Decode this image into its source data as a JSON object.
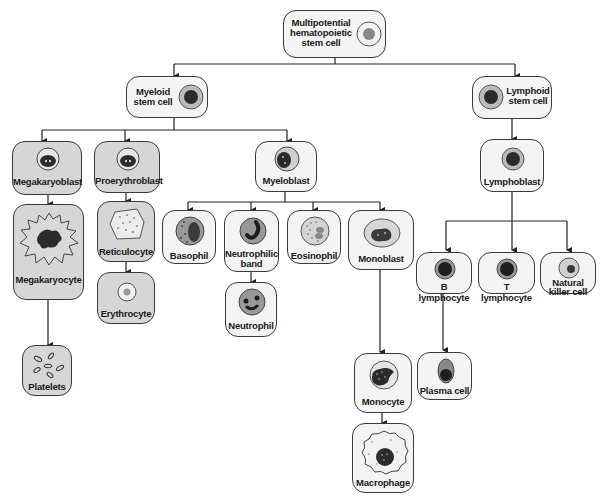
{
  "colors": {
    "box_fill": "#e9e9e9",
    "box_fill_light": "#f4f4f4",
    "box_fill_dark": "#d6d6d6",
    "box_border": "#3a3a3a",
    "nucleus_dark": "#2b2b2b",
    "nucleus_gray": "#7a7a7a",
    "cytoplasm": "#bdbdbd",
    "line": "#222222"
  },
  "nodes": {
    "stem": {
      "label": "Multipotential hematopoietic stem cell",
      "line1": "Multipotential",
      "line2": "hematopoietic",
      "line3": "stem cell",
      "icon": "stem-cell-icon"
    },
    "myeloid": {
      "label": "Myeloid stem cell",
      "line1": "Myeloid",
      "line2": "stem cell",
      "icon": "myeloid-stem-cell-icon"
    },
    "lymphoid": {
      "label": "Lymphoid stem cell",
      "line1": "Lymphoid",
      "line2": "stem cell",
      "icon": "lymphoid-stem-cell-icon"
    },
    "megakaryoblast": {
      "label": "Megakaryoblast",
      "icon": "megakaryoblast-icon"
    },
    "proerythroblast": {
      "label": "Proerythroblast",
      "icon": "proerythroblast-icon"
    },
    "myeloblast": {
      "label": "Myeloblast",
      "icon": "myeloblast-icon"
    },
    "lymphoblast": {
      "label": "Lymphoblast",
      "icon": "lymphoblast-icon"
    },
    "megakaryocyte": {
      "label": "Megakaryocyte",
      "icon": "megakaryocyte-icon"
    },
    "reticulocyte": {
      "label": "Reticulocyte",
      "icon": "reticulocyte-icon"
    },
    "erythrocyte": {
      "label": "Erythrocyte",
      "icon": "erythrocyte-icon"
    },
    "platelets": {
      "label": "Platelets",
      "icon": "platelets-icon"
    },
    "basophil": {
      "label": "Basophil",
      "icon": "basophil-icon"
    },
    "neutrophilic_band": {
      "label": "Neutrophilic band",
      "line1": "Neutrophilic",
      "line2": "band",
      "icon": "neutrophilic-band-icon"
    },
    "eosinophil": {
      "label": "Eosinophil",
      "icon": "eosinophil-icon"
    },
    "monoblast": {
      "label": "Monoblast",
      "icon": "monoblast-icon"
    },
    "neutrophil": {
      "label": "Neutrophil",
      "icon": "neutrophil-icon"
    },
    "monocyte": {
      "label": "Monocyte",
      "icon": "monocyte-icon"
    },
    "macrophage": {
      "label": "Macrophage",
      "icon": "macrophage-icon"
    },
    "b_lymphocyte": {
      "label": "B lymphocyte",
      "icon": "b-lymphocyte-icon"
    },
    "t_lymphocyte": {
      "label": "T lymphocyte",
      "icon": "t-lymphocyte-icon"
    },
    "nk_cell": {
      "label": "Natural killer cell",
      "line1": "Natural",
      "line2": "killer cell",
      "icon": "natural-killer-cell-icon"
    },
    "plasma_cell": {
      "label": "Plasma cell",
      "icon": "plasma-cell-icon"
    }
  },
  "edges": [
    [
      "stem",
      "myeloid"
    ],
    [
      "stem",
      "lymphoid"
    ],
    [
      "myeloid",
      "megakaryoblast"
    ],
    [
      "myeloid",
      "proerythroblast"
    ],
    [
      "myeloid",
      "myeloblast"
    ],
    [
      "lymphoid",
      "lymphoblast"
    ],
    [
      "megakaryoblast",
      "megakaryocyte"
    ],
    [
      "megakaryocyte",
      "platelets"
    ],
    [
      "proerythroblast",
      "reticulocyte"
    ],
    [
      "reticulocyte",
      "erythrocyte"
    ],
    [
      "myeloblast",
      "basophil"
    ],
    [
      "myeloblast",
      "neutrophilic_band"
    ],
    [
      "myeloblast",
      "eosinophil"
    ],
    [
      "myeloblast",
      "monoblast"
    ],
    [
      "neutrophilic_band",
      "neutrophil"
    ],
    [
      "monoblast",
      "monocyte"
    ],
    [
      "monocyte",
      "macrophage"
    ],
    [
      "lymphoblast",
      "b_lymphocyte"
    ],
    [
      "lymphoblast",
      "t_lymphocyte"
    ],
    [
      "lymphoblast",
      "nk_cell"
    ],
    [
      "b_lymphocyte",
      "plasma_cell"
    ]
  ]
}
